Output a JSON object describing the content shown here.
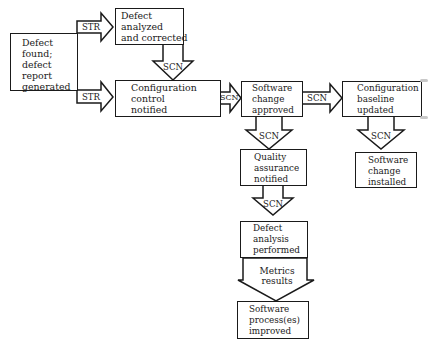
{
  "diagram": {
    "type": "flowchart",
    "nodes": {
      "defect_found": {
        "lines": [
          "Defect",
          "found;",
          "defect",
          "report",
          "generated"
        ]
      },
      "defect_analyzed": {
        "lines": [
          "Defect",
          "analyzed",
          "and corrected"
        ]
      },
      "config_control": {
        "lines": [
          "Configuration",
          "control",
          "notified"
        ]
      },
      "software_change_approved": {
        "lines": [
          "Software",
          "change",
          "approved"
        ]
      },
      "config_baseline": {
        "lines": [
          "Configuration",
          "baseline",
          "updated"
        ]
      },
      "quality_assurance": {
        "lines": [
          "Quality",
          "assurance",
          "notified"
        ]
      },
      "software_change_installed": {
        "lines": [
          "Software",
          "change",
          "installed"
        ]
      },
      "defect_analysis": {
        "lines": [
          "Defect",
          "analysis",
          "performed"
        ]
      },
      "process_improved": {
        "lines": [
          "Software",
          "process(es)",
          "improved"
        ]
      }
    },
    "edges": {
      "str_top": {
        "label": "STR",
        "from": "defect_found",
        "to": "defect_analyzed"
      },
      "str_bottom": {
        "label": "STR",
        "from": "defect_found",
        "to": "config_control"
      },
      "scn_analyzed_to_control": {
        "label": "SCN",
        "from": "defect_analyzed",
        "to": "config_control"
      },
      "scn_control_to_approved": {
        "label": "SCN",
        "from": "config_control",
        "to": "software_change_approved"
      },
      "scn_approved_to_baseline": {
        "label": "SCN",
        "from": "software_change_approved",
        "to": "config_baseline"
      },
      "scn_approved_to_qa": {
        "label": "SCN",
        "from": "software_change_approved",
        "to": "quality_assurance"
      },
      "scn_baseline_to_installed": {
        "label": "SCN",
        "from": "config_baseline",
        "to": "software_change_installed"
      },
      "scn_qa_to_analysis": {
        "label": "SCN",
        "from": "quality_assurance",
        "to": "defect_analysis"
      },
      "metrics": {
        "label_lines": [
          "Metrics",
          "results"
        ],
        "from": "defect_analysis",
        "to": "process_improved"
      }
    }
  }
}
